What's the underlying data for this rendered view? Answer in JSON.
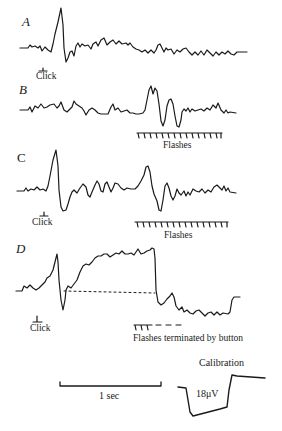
{
  "figure": {
    "panels": [
      {
        "letter": "A",
        "stimulus_label": "Click",
        "marker_label": ""
      },
      {
        "letter": "B",
        "stimulus_label": "",
        "marker_label": "Flashes"
      },
      {
        "letter": "C",
        "stimulus_label": "Click",
        "marker_label": "Flashes"
      },
      {
        "letter": "D",
        "stimulus_label": "Click",
        "marker_label": "Flashes terminated by button"
      }
    ],
    "time_scale": {
      "label": "1 sec"
    },
    "calibration": {
      "title": "Calibration",
      "value": "18μV"
    },
    "colors": {
      "trace": "#1a1a1a",
      "background": "#ffffff"
    }
  }
}
